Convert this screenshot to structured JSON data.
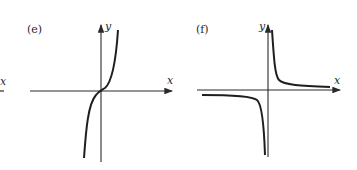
{
  "panels": [
    {
      "label": "(e)",
      "x_axis": "x",
      "y_axis": "y",
      "curve": "cubic-like increasing through origin"
    },
    {
      "label": "(f)",
      "x_axis": "x",
      "y_axis": "y",
      "curve": "hyperbola y = 1/x"
    }
  ],
  "cropped_left": {
    "x_axis": "x"
  },
  "colors": {
    "ink": "#2a2a2a",
    "background": "#ffffff"
  }
}
